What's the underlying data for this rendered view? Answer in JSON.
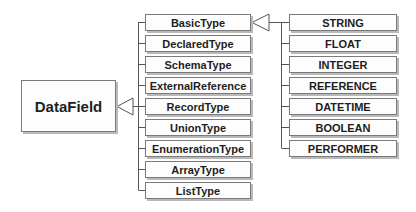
{
  "diagram": {
    "type": "uml-class-hierarchy",
    "root": {
      "label": "DataField"
    },
    "subtypes": [
      {
        "label": "BasicType"
      },
      {
        "label": "DeclaredType"
      },
      {
        "label": "SchemaType"
      },
      {
        "label": "ExternalReference"
      },
      {
        "label": "RecordType"
      },
      {
        "label": "UnionType"
      },
      {
        "label": "EnumerationType"
      },
      {
        "label": "ArrayType"
      },
      {
        "label": "ListType"
      }
    ],
    "basic_type_values": [
      {
        "label": "STRING"
      },
      {
        "label": "FLOAT"
      },
      {
        "label": "INTEGER"
      },
      {
        "label": "REFERENCE"
      },
      {
        "label": "DATETIME"
      },
      {
        "label": "BOOLEAN"
      },
      {
        "label": "PERFORMER"
      }
    ],
    "relations": [
      {
        "from": "subtypes",
        "to": "DataField",
        "kind": "generalization"
      },
      {
        "from": "basic_type_values",
        "to": "BasicType",
        "kind": "generalization"
      }
    ]
  }
}
